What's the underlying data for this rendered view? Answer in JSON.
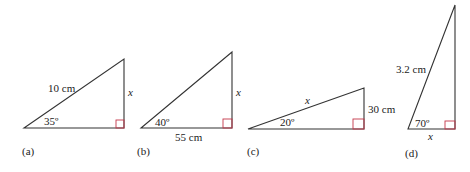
{
  "figures": [
    {
      "id": "a",
      "caption": "(a)",
      "hypotenuse_label": "10 cm",
      "angle_label": "35º",
      "opposite_label": "x",
      "vertices": {
        "left": [
          24,
          128
        ],
        "right": [
          124,
          128
        ],
        "top": [
          124,
          59
        ]
      }
    },
    {
      "id": "b",
      "caption": "(b)",
      "adjacent_label": "55 cm",
      "angle_label": "40º",
      "opposite_label": "x",
      "vertices": {
        "left": [
          141,
          128
        ],
        "right": [
          232,
          128
        ],
        "top": [
          232,
          52
        ]
      }
    },
    {
      "id": "c",
      "caption": "(c)",
      "hypotenuse_label": "x",
      "angle_label": "20º",
      "opposite_label": "30 cm",
      "vertices": {
        "left": [
          248,
          129
        ],
        "right": [
          364,
          129
        ],
        "top": [
          364,
          88
        ]
      }
    },
    {
      "id": "d",
      "caption": "(d)",
      "hypotenuse_label": "3.2 cm",
      "angle_label": "70º",
      "adjacent_label": "x",
      "vertices": {
        "left": [
          408,
          129
        ],
        "right": [
          455,
          129
        ],
        "top": [
          455,
          5
        ]
      }
    }
  ],
  "colors": {
    "edge": "#333333",
    "right_angle": "#c4374a",
    "text": "#222222"
  }
}
